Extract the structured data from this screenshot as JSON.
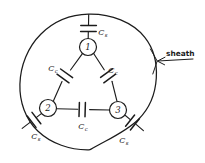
{
  "figure": {
    "style": "hand-drawn pen sketch, black ink on white",
    "ink_color": "#1c1c1c",
    "background_color": "#ffffff"
  },
  "sheath": {
    "label": "sheath",
    "shape": "circle",
    "center": [
      88,
      82
    ],
    "radius": 68,
    "annotation_arrow": {
      "from": [
        198,
        59
      ],
      "to": [
        152,
        62
      ],
      "points_to": "sheath-circle"
    }
  },
  "nodes": [
    {
      "id": "node-1",
      "label": "1",
      "cx": 88,
      "cy": 47,
      "r": 8.5
    },
    {
      "id": "node-2",
      "label": "2",
      "cx": 48,
      "cy": 108,
      "r": 8.5
    },
    {
      "id": "node-3",
      "label": "3",
      "cx": 118,
      "cy": 110,
      "r": 8.5
    }
  ],
  "capacitors": [
    {
      "id": "cap-core-sheath-1",
      "kind": "core-to-sheath",
      "between": [
        "node-1",
        "sheath"
      ],
      "symbol": "C",
      "subscript": "s",
      "label_text": "C",
      "label_x": 103,
      "label_y": 35
    },
    {
      "id": "cap-core-sheath-2",
      "kind": "core-to-sheath",
      "between": [
        "node-2",
        "sheath"
      ],
      "symbol": "C",
      "subscript": "s",
      "label_text": "C",
      "label_x": 36,
      "label_y": 139
    },
    {
      "id": "cap-core-sheath-3",
      "kind": "core-to-sheath",
      "between": [
        "node-3",
        "sheath"
      ],
      "symbol": "C",
      "subscript": "s",
      "label_text": "C",
      "label_x": 124,
      "label_y": 143
    },
    {
      "id": "cap-core-core-12",
      "kind": "core-to-core",
      "between": [
        "node-1",
        "node-2"
      ],
      "symbol": "C",
      "subscript": "c",
      "label_text": "C",
      "label_x": 53,
      "label_y": 71
    },
    {
      "id": "cap-core-core-13",
      "kind": "core-to-core",
      "between": [
        "node-1",
        "node-3"
      ],
      "symbol": "C",
      "subscript": "c",
      "label_text": "C",
      "label_x": 113,
      "label_y": 73
    },
    {
      "id": "cap-core-core-23",
      "kind": "core-to-core",
      "between": [
        "node-2",
        "node-3"
      ],
      "symbol": "C",
      "subscript": "c",
      "label_text": "C",
      "label_x": 83,
      "label_y": 129
    }
  ]
}
